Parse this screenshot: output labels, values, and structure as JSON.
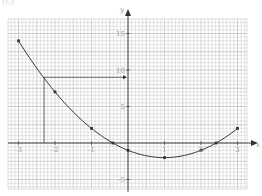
{
  "part_label": "(c)",
  "chart_data": {
    "type": "line",
    "title": "",
    "function": "y = x^2 - 2x - 1",
    "xlabel": "x",
    "ylabel": "y",
    "xlim": [
      -3.3,
      3.3
    ],
    "ylim": [
      -6.3,
      17
    ],
    "grid": true,
    "x_ticks": [
      -3,
      -2,
      -1,
      1,
      2,
      3
    ],
    "x_tick_labels": [
      "-3",
      "-2",
      "-1",
      "1",
      "2",
      "3"
    ],
    "y_ticks": [
      15,
      10,
      5,
      -5
    ],
    "y_tick_labels": [
      "15",
      "10",
      "5",
      "-5"
    ],
    "points": [
      {
        "x": -3,
        "y": 14
      },
      {
        "x": -2,
        "y": 7
      },
      {
        "x": -1,
        "y": 2
      },
      {
        "x": -0.414,
        "y": 0
      },
      {
        "x": 0,
        "y": -1
      },
      {
        "x": 1,
        "y": -2
      },
      {
        "x": 2,
        "y": -1
      },
      {
        "x": 2.414,
        "y": 0
      },
      {
        "x": 3,
        "y": 2
      }
    ],
    "guide_lines": [
      {
        "type": "horizontal",
        "y": 9,
        "from_x": -2.3,
        "to_x": 0,
        "arrow": true
      },
      {
        "type": "vertical",
        "x": -2.3,
        "from_y": 9,
        "to_y": 0
      }
    ]
  },
  "colors": {
    "grid_minor": "#c8c8c8",
    "grid_major": "#a0a0a0",
    "axis": "#333333",
    "curve": "#333333",
    "label": "#9a9a9a"
  }
}
